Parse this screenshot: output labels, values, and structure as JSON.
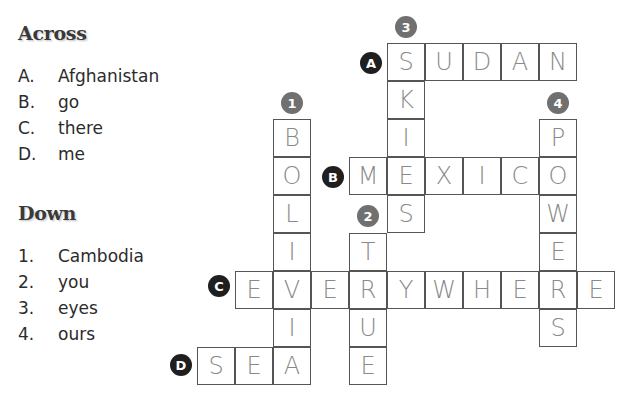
{
  "across": {
    "heading": "Across",
    "clues": [
      {
        "num": "A.",
        "text": "Afghanistan"
      },
      {
        "num": "B.",
        "text": "go"
      },
      {
        "num": "C.",
        "text": "there"
      },
      {
        "num": "D.",
        "text": "me"
      }
    ]
  },
  "down": {
    "heading": "Down",
    "clues": [
      {
        "num": "1.",
        "text": "Cambodia"
      },
      {
        "num": "2.",
        "text": "you"
      },
      {
        "num": "3.",
        "text": "eyes"
      },
      {
        "num": "4.",
        "text": "ours"
      }
    ]
  },
  "badges": {
    "A": "A",
    "B": "B",
    "C": "C",
    "D": "D",
    "n1": "1",
    "n2": "2",
    "n3": "3",
    "n4": "4"
  },
  "grid": {
    "A": [
      "S",
      "U",
      "D",
      "A",
      "N"
    ],
    "B": [
      "M",
      "E",
      "X",
      "I",
      "C",
      "O"
    ],
    "C": [
      "E",
      "V",
      "E",
      "R",
      "Y",
      "W",
      "H",
      "E",
      "R",
      "E"
    ],
    "D": [
      "S",
      "E",
      "A"
    ],
    "d1": [
      "B",
      "O",
      "L",
      "I",
      "V",
      "I",
      "A"
    ],
    "d2": [
      "T",
      "R",
      "U",
      "E"
    ],
    "d3": [
      "S",
      "K",
      "I",
      "E",
      "S"
    ],
    "d4": [
      "P",
      "O",
      "W",
      "E",
      "R",
      "S"
    ]
  },
  "colors": {
    "across_badge": "#1f1f1f",
    "down_badge": "#707070",
    "handwriting": "#8a8a8a"
  }
}
